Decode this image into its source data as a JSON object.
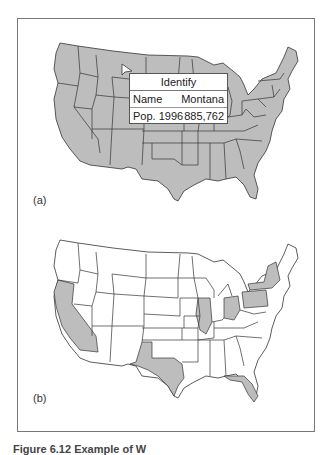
{
  "figure": {
    "caption": "Figure 6.12   Example of W",
    "colors": {
      "state_fill_shaded": "#bdbdbd",
      "state_fill_blank": "#ffffff",
      "border": "#333333",
      "frame": "#777777"
    }
  },
  "panels": [
    {
      "label": "(a)",
      "map": "United States (conterminous)",
      "all_states_shaded": true,
      "identify_popup": {
        "title": "Identify",
        "rows": [
          {
            "field": "Name",
            "value": "Montana"
          },
          {
            "field": "Pop. 1996",
            "value": "885,762"
          }
        ]
      },
      "cursor_icon": "arrow-pointer-icon"
    },
    {
      "label": "(b)",
      "map": "United States (conterminous)",
      "all_states_shaded": false,
      "highlighted_states": [
        "California",
        "Texas",
        "Illinois",
        "Ohio",
        "Pennsylvania",
        "New York",
        "Florida"
      ]
    }
  ]
}
